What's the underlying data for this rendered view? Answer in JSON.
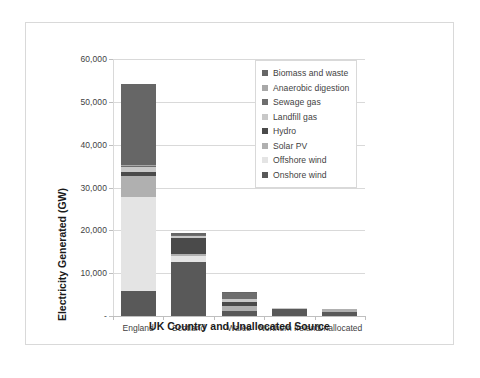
{
  "chart_data": {
    "type": "bar",
    "stacked": true,
    "title": "",
    "xlabel": "UK Country and Unallocated Source",
    "ylabel": "Electricity Generated (GW)",
    "categories": [
      "England",
      "Scotland",
      "Wales",
      "Northern Ireland",
      "Unallocated"
    ],
    "ylim": [
      0,
      60000
    ],
    "yticks": [
      0,
      10000,
      20000,
      30000,
      40000,
      50000,
      60000
    ],
    "ytick_labels": [
      "-",
      "10,000",
      "20,000",
      "30,000",
      "40,000",
      "50,000",
      "60,000"
    ],
    "grid": true,
    "legend_position": "inside-top-right",
    "series": [
      {
        "name": "Onshore wind",
        "color": "#595959",
        "values": [
          5800,
          12600,
          1100,
          1650,
          950
        ]
      },
      {
        "name": "Offshore wind",
        "color": "#e4e4e4",
        "values": [
          22000,
          1500,
          0,
          0,
          0
        ]
      },
      {
        "name": "Solar PV",
        "color": "#b0b0b0",
        "values": [
          5000,
          300,
          1250,
          0,
          600
        ]
      },
      {
        "name": "Hydro",
        "color": "#4a4a4a",
        "values": [
          900,
          3900,
          900,
          60,
          0
        ]
      },
      {
        "name": "Landfill gas",
        "color": "#c8c8c8",
        "values": [
          1000,
          300,
          700,
          50,
          0
        ]
      },
      {
        "name": "Sewage gas",
        "color": "#6e6e6e",
        "values": [
          300,
          250,
          1400,
          80,
          0
        ]
      },
      {
        "name": "Anaerobic digestion",
        "color": "#a8a8a8",
        "values": [
          200,
          150,
          100,
          40,
          0
        ]
      },
      {
        "name": "Biomass and waste",
        "color": "#666666",
        "values": [
          19100,
          350,
          100,
          60,
          0
        ]
      }
    ],
    "totals": [
      54300,
      19350,
      5550,
      1940,
      1550
    ],
    "legend_order": [
      "Biomass and waste",
      "Anaerobic digestion",
      "Sewage gas",
      "Landfill gas",
      "Hydro",
      "Solar PV",
      "Offshore wind",
      "Onshore wind"
    ],
    "legend_colors": {
      "Biomass and waste": "#666666",
      "Anaerobic digestion": "#a8a8a8",
      "Sewage gas": "#6e6e6e",
      "Landfill gas": "#c8c8c8",
      "Hydro": "#4a4a4a",
      "Solar PV": "#b0b0b0",
      "Offshore wind": "#e4e4e4",
      "Onshore wind": "#595959"
    }
  }
}
